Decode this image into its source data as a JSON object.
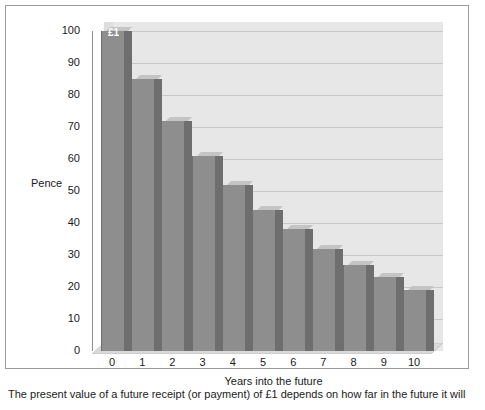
{
  "caption": "The present value of a future receipt (or payment) of £1 depends on how far in the future it will",
  "chart_data": {
    "type": "bar",
    "title": "",
    "subtitle": "",
    "xlabel": "Years into the future",
    "ylabel": "Pence",
    "categories": [
      "0",
      "1",
      "2",
      "3",
      "4",
      "5",
      "6",
      "7",
      "8",
      "9",
      "10"
    ],
    "values": [
      100,
      85,
      72,
      61,
      52,
      44,
      38,
      32,
      27,
      23,
      19
    ],
    "ylim": [
      0,
      100
    ],
    "yticks": [
      0,
      10,
      20,
      30,
      40,
      50,
      60,
      70,
      80,
      90,
      100
    ],
    "ytick_labels": [
      "0",
      "10",
      "20",
      "30",
      "40",
      "50",
      "60",
      "70",
      "80",
      "90",
      "100"
    ],
    "grid": true,
    "legend": "none",
    "style": "3d-bar",
    "annotations": [
      {
        "text": "£1",
        "category": "0",
        "position": "bar-top-inside"
      }
    ],
    "colors": {
      "bar_front": "#8e8e8e",
      "bar_side": "#6e6e6e",
      "bar_top": "#c4c4c4",
      "plot_background": "#e7e7e7",
      "gridline": "#c8c8c8",
      "axis": "#8f8f8f",
      "text": "#1a1a1a",
      "frame": "#9a9a9a",
      "page_background": "#ffffff"
    }
  }
}
